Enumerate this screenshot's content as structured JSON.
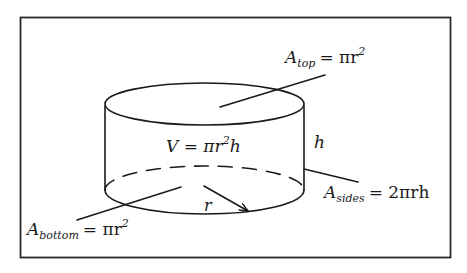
{
  "figure": {
    "frame_color": "#2a2a2a",
    "ink_color": "#1a1a1a",
    "background": "#ffffff"
  },
  "labels": {
    "top_area": {
      "symbol": "A",
      "subscript": "top",
      "rhs": "= πr",
      "exp": "2"
    },
    "volume": {
      "lhs": "V = πr",
      "exp": "2",
      "tail": "h"
    },
    "height": {
      "text": "h"
    },
    "sides_area": {
      "symbol": "A",
      "subscript": "sides",
      "rhs": "= 2πrh"
    },
    "bottom_area": {
      "symbol": "A",
      "subscript": "bottom",
      "rhs": "= πr",
      "exp": "2"
    },
    "radius": {
      "text": "r"
    }
  }
}
